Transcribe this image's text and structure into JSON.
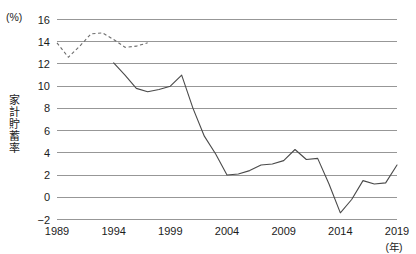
{
  "chart_data": {
    "type": "line",
    "title": "",
    "subtitle": "",
    "unit_label": "(%)",
    "xlabel": "(年)",
    "ylabel": "家計貯蓄率",
    "xlim": [
      1989,
      2019
    ],
    "ylim": [
      -2,
      16
    ],
    "grid": true,
    "legend": "none",
    "x_ticks": [
      "1989",
      "1994",
      "1999",
      "2004",
      "2009",
      "2014",
      "2019"
    ],
    "x_tick_values": [
      1989,
      1994,
      1999,
      2004,
      2009,
      2014,
      2019
    ],
    "y_ticks": [
      "16",
      "14",
      "12",
      "10",
      "8",
      "6",
      "4",
      "2",
      "0",
      "−2"
    ],
    "y_tick_values": [
      16,
      14,
      12,
      10,
      8,
      6,
      4,
      2,
      0,
      -2
    ],
    "series": [
      {
        "name": "旧基準（68SNA）",
        "style": "dashed",
        "color": "#6d6d6d",
        "x": [
          1989,
          1990,
          1991,
          1992,
          1993,
          1994,
          1995,
          1996,
          1997
        ],
        "values": [
          13.9,
          12.6,
          13.6,
          14.7,
          14.8,
          14.2,
          13.5,
          13.6,
          13.9
        ]
      },
      {
        "name": "家計貯蓄率",
        "style": "solid",
        "color": "#4a4a4a",
        "x": [
          1994,
          1995,
          1996,
          1997,
          1998,
          1999,
          2000,
          2001,
          2002,
          2003,
          2004,
          2005,
          2006,
          2007,
          2008,
          2009,
          2010,
          2011,
          2012,
          2013,
          2014,
          2015,
          2016,
          2017,
          2018,
          2019
        ],
        "values": [
          12.1,
          11.0,
          9.8,
          9.5,
          9.7,
          10.0,
          11.0,
          8.0,
          5.5,
          3.9,
          2.0,
          2.1,
          2.4,
          2.9,
          3.0,
          3.3,
          4.3,
          3.4,
          3.5,
          1.2,
          -1.4,
          -0.2,
          1.5,
          1.2,
          1.3,
          2.9
        ]
      }
    ],
    "annotations": []
  }
}
